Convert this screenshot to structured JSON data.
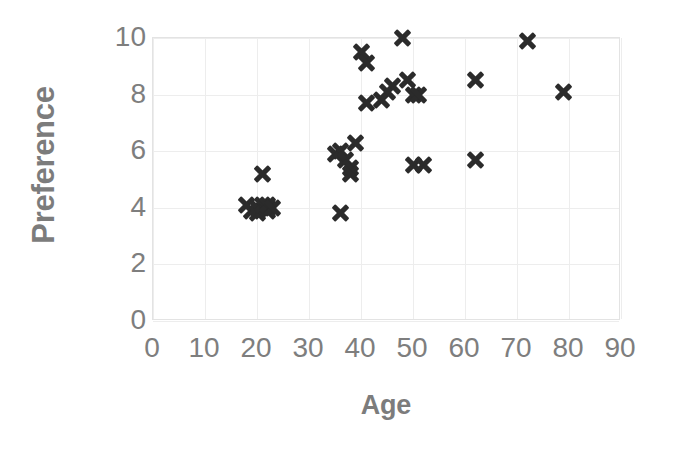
{
  "chart_data": {
    "type": "scatter",
    "title": "",
    "xlabel": "Age",
    "ylabel": "Preference",
    "xlim": [
      0,
      90
    ],
    "ylim": [
      0,
      10
    ],
    "xticks": [
      0,
      10,
      20,
      30,
      40,
      50,
      60,
      70,
      80,
      90
    ],
    "yticks": [
      0,
      2,
      4,
      6,
      8,
      10
    ],
    "grid": true,
    "legend": "none",
    "marker": "x",
    "marker_color": "#2b2b2b",
    "x": [
      18,
      19,
      20,
      20,
      21,
      21,
      22,
      22,
      22,
      23,
      36,
      35,
      36,
      37,
      38,
      38,
      39,
      40,
      41,
      41,
      44,
      45,
      46,
      48,
      49,
      50,
      50,
      51,
      52,
      62,
      62,
      72,
      79
    ],
    "y": [
      4.1,
      3.9,
      3.8,
      4.0,
      4.1,
      5.2,
      3.9,
      4.0,
      4.1,
      4.0,
      3.8,
      5.9,
      6.0,
      5.7,
      5.4,
      5.2,
      6.3,
      9.5,
      9.1,
      7.7,
      7.8,
      8.1,
      8.3,
      10.0,
      8.5,
      8.0,
      5.5,
      8.0,
      5.5,
      8.5,
      5.7,
      9.9,
      8.1
    ],
    "points": [
      {
        "x": 18,
        "y": 4.1
      },
      {
        "x": 19,
        "y": 3.9
      },
      {
        "x": 20,
        "y": 3.8
      },
      {
        "x": 20,
        "y": 4.0
      },
      {
        "x": 21,
        "y": 4.1
      },
      {
        "x": 21,
        "y": 5.2
      },
      {
        "x": 22,
        "y": 3.9
      },
      {
        "x": 22,
        "y": 4.0
      },
      {
        "x": 22,
        "y": 4.1
      },
      {
        "x": 23,
        "y": 4.0
      },
      {
        "x": 36,
        "y": 3.8
      },
      {
        "x": 35,
        "y": 5.9
      },
      {
        "x": 36,
        "y": 6.0
      },
      {
        "x": 37,
        "y": 5.7
      },
      {
        "x": 38,
        "y": 5.4
      },
      {
        "x": 38,
        "y": 5.2
      },
      {
        "x": 39,
        "y": 6.3
      },
      {
        "x": 40,
        "y": 9.5
      },
      {
        "x": 41,
        "y": 9.1
      },
      {
        "x": 41,
        "y": 7.7
      },
      {
        "x": 44,
        "y": 7.8
      },
      {
        "x": 45,
        "y": 8.1
      },
      {
        "x": 46,
        "y": 8.3
      },
      {
        "x": 48,
        "y": 10.0
      },
      {
        "x": 49,
        "y": 8.5
      },
      {
        "x": 50,
        "y": 8.0
      },
      {
        "x": 50,
        "y": 5.5
      },
      {
        "x": 51,
        "y": 8.0
      },
      {
        "x": 52,
        "y": 5.5
      },
      {
        "x": 62,
        "y": 8.5
      },
      {
        "x": 62,
        "y": 5.7
      },
      {
        "x": 72,
        "y": 9.9
      },
      {
        "x": 79,
        "y": 8.1
      }
    ]
  },
  "axes": {
    "x_title": "Age",
    "y_title": "Preference",
    "x_tick_labels": [
      "0",
      "10",
      "20",
      "30",
      "40",
      "50",
      "60",
      "70",
      "80",
      "90"
    ],
    "y_tick_labels": [
      "0",
      "2",
      "4",
      "6",
      "8",
      "10"
    ]
  },
  "colors": {
    "marker": "#2b2b2b",
    "grid": "#ededed",
    "axis_text": "#7e7e7e",
    "title_text": "#7c7c7c",
    "background": "#ffffff"
  }
}
